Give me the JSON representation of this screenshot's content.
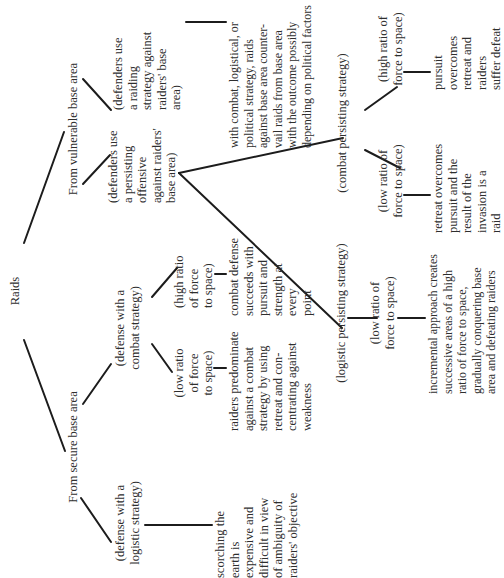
{
  "diagram": {
    "root": "Raids",
    "branches": {
      "secure": {
        "label": "From secure base area",
        "logistic": {
          "label": "(defense with a\nlogistic strategy)",
          "outcome": "scorching the\nearth is\nexpensive and\ndifficult in view\nof ambiguity of\nraiders' objective"
        },
        "combat": {
          "label": "(defense with a\ncombat strategy)",
          "low": {
            "label": "(low ratio\nof force\nto space)",
            "outcome": "raiders predominate\nagainst a combat\nstrategy by using\nretreat and con-\ncentrating against\nweakness"
          },
          "high": {
            "label": "(high ratio\nof force\nto space)",
            "outcome": "combat defense\nsucceeds with\npursuit and\nstrength at\nevery\npoint"
          }
        }
      },
      "vulnerable": {
        "label": "From vulnerable base area",
        "persisting": {
          "label": "(defenders use\na persisting\noffensive\nagainst raiders'\nbase area)",
          "logistic": {
            "label": "(logistic persisting strategy)",
            "low": {
              "label": "(low ratio of\nforce to space)",
              "outcome": "incremental approach creates\nsuccessive areas of a high\nratio of force to space,\ngradually conquering base\narea and defeating raiders"
            }
          },
          "combat": {
            "label": "(combat persisting strategy)",
            "low": {
              "label": "(low ratio of\nforce to space)",
              "outcome": "retreat overcomes\npursuit and the\nresult of the\ninvasion is a\nraid"
            },
            "high": {
              "label": "(high ratio of\nforce to space)",
              "outcome": "pursuit\novercomes\nretreat and\nraiders\nsuffer defeat"
            }
          }
        },
        "raiding": {
          "label": "(defenders use\na raiding\nstrategy against\nraiders' base\narea)",
          "outcome": "with combat, logistical, or\npolitical strategy, raids\nagainst base area counter-\nvail raids from base area\nwith the outcome possibly\ndepending on political factors"
        }
      }
    }
  }
}
